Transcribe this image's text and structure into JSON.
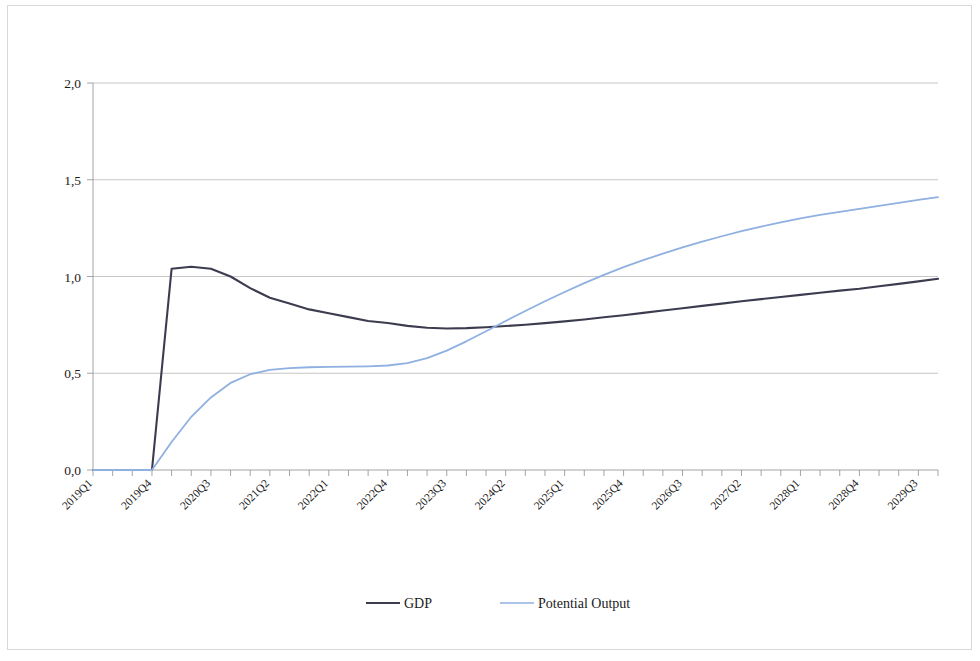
{
  "chart_data": {
    "type": "line",
    "title": "",
    "subtitle": "",
    "xlabel": "",
    "ylabel": "",
    "ylim": [
      0.0,
      2.0
    ],
    "yticks": [
      "0,0",
      "0,5",
      "1,0",
      "1,5",
      "2,0"
    ],
    "ytick_values": [
      0.0,
      0.5,
      1.0,
      1.5,
      2.0
    ],
    "grid": "horizontal",
    "legend_position": "bottom",
    "decimal_separator": ",",
    "xtick_labels": [
      "2019Q1",
      "2019Q4",
      "2020Q3",
      "2021Q2",
      "2022Q1",
      "2022Q4",
      "2023Q3",
      "2024Q2",
      "2025Q1",
      "2025Q4",
      "2026Q3",
      "2027Q2",
      "2028Q1",
      "2028Q4",
      "2029Q3"
    ],
    "x": [
      "2019Q1",
      "2019Q2",
      "2019Q3",
      "2019Q4",
      "2020Q1",
      "2020Q2",
      "2020Q3",
      "2020Q4",
      "2021Q1",
      "2021Q2",
      "2021Q3",
      "2021Q4",
      "2022Q1",
      "2022Q2",
      "2022Q3",
      "2022Q4",
      "2023Q1",
      "2023Q2",
      "2023Q3",
      "2023Q4",
      "2024Q1",
      "2024Q2",
      "2024Q3",
      "2024Q4",
      "2025Q1",
      "2025Q2",
      "2025Q3",
      "2025Q4",
      "2026Q1",
      "2026Q2",
      "2026Q3",
      "2026Q4",
      "2027Q1",
      "2027Q2",
      "2027Q3",
      "2027Q4",
      "2028Q1",
      "2028Q2",
      "2028Q3",
      "2028Q4",
      "2029Q1",
      "2029Q2",
      "2029Q3",
      "2029Q4"
    ],
    "series": [
      {
        "name": "GDP",
        "color": "#3c3c50",
        "width": 2.1,
        "values": [
          0.0,
          0.0,
          0.0,
          0.0,
          1.04,
          1.05,
          1.04,
          1.0,
          0.94,
          0.89,
          0.86,
          0.83,
          0.81,
          0.79,
          0.77,
          0.76,
          0.745,
          0.735,
          0.731,
          0.733,
          0.738,
          0.744,
          0.751,
          0.759,
          0.768,
          0.778,
          0.789,
          0.8,
          0.812,
          0.824,
          0.836,
          0.848,
          0.86,
          0.872,
          0.883,
          0.894,
          0.905,
          0.916,
          0.927,
          0.937,
          0.95,
          0.962,
          0.975,
          0.988
        ]
      },
      {
        "name": "Potential Output",
        "color": "#8fb0e0",
        "width": 1.8,
        "values": [
          0.0,
          0.0,
          0.0,
          0.0,
          0.145,
          0.275,
          0.375,
          0.45,
          0.495,
          0.517,
          0.527,
          0.531,
          0.533,
          0.534,
          0.536,
          0.54,
          0.552,
          0.578,
          0.617,
          0.665,
          0.717,
          0.77,
          0.822,
          0.872,
          0.92,
          0.966,
          1.008,
          1.048,
          1.085,
          1.118,
          1.15,
          1.18,
          1.208,
          1.234,
          1.258,
          1.28,
          1.3,
          1.318,
          1.334,
          1.349,
          1.365,
          1.381,
          1.396,
          1.41
        ]
      }
    ],
    "annotations": []
  },
  "legend": {
    "items": [
      {
        "label": "GDP",
        "color": "#3c3c50"
      },
      {
        "label": "Potential Output",
        "color": "#8fb0e0"
      }
    ]
  }
}
